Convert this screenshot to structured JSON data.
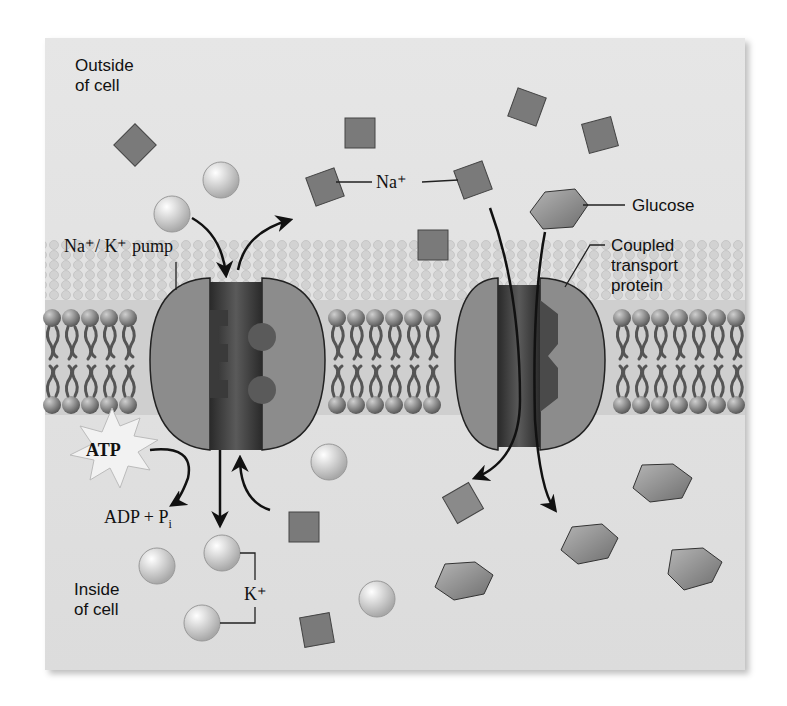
{
  "diagram": {
    "labels": {
      "outside": "Outside\nof cell",
      "outside_line1": "Outside",
      "outside_line2": "of cell",
      "inside_line1": "Inside",
      "inside_line2": "of cell",
      "pump": "Na⁺/ K⁺ pump",
      "na": "Na⁺",
      "k": "K⁺",
      "glucose": "Glucose",
      "coupled_line1": "Coupled",
      "coupled_line2": "transport",
      "coupled_line3": "protein",
      "atp": "ATP",
      "adp": "ADP + P",
      "adp_sub": "i"
    },
    "colors": {
      "background": "#e0e0e0",
      "protein": "#8a8a8a",
      "channel": "#3a3a3a",
      "ion": "#d4d4d4",
      "sodium": "#7a7a7a",
      "glucose": "#8e8e8e"
    }
  }
}
